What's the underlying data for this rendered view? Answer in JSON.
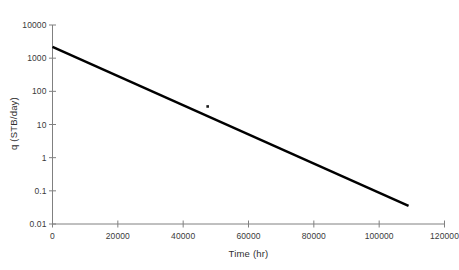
{
  "chart_data": {
    "type": "line",
    "title": "",
    "xlabel": "Time (hr)",
    "ylabel": "q (STB/day)",
    "xlim": [
      0,
      120000
    ],
    "ylim": [
      0.01,
      10000
    ],
    "yscale": "log",
    "xscale": "linear",
    "grid": false,
    "legend": null,
    "xticks": [
      0,
      20000,
      40000,
      60000,
      80000,
      100000,
      120000
    ],
    "xtick_labels": [
      "0",
      "20000",
      "40000",
      "60000",
      "80000",
      "100000",
      "120000"
    ],
    "yticks": [
      0.01,
      0.1,
      1,
      10,
      100,
      1000,
      10000
    ],
    "ytick_labels": [
      "0.01",
      "0.1",
      "1",
      "10",
      "100",
      "1000",
      "10000"
    ],
    "series": [
      {
        "name": "decline-curve",
        "type": "line",
        "color": "#000000",
        "linewidth": 2.4,
        "x": [
          0,
          109000
        ],
        "y": [
          2200,
          0.035
        ]
      },
      {
        "name": "isolated-point",
        "type": "scatter",
        "color": "#1a1a1a",
        "markersize": 2.6,
        "x": [
          47500
        ],
        "y": [
          35
        ]
      }
    ]
  },
  "axis": {
    "line_color": "#808080",
    "tick_color": "#808080"
  }
}
